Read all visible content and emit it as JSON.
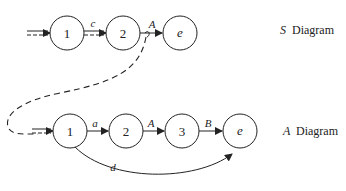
{
  "diagrams": [
    {
      "id": "S",
      "caption_symbol": "S",
      "caption_text": "Diagram",
      "nodes": [
        {
          "label": "1",
          "italic": false
        },
        {
          "label": "2",
          "italic": false
        },
        {
          "label": "e",
          "italic": true
        }
      ],
      "edges": [
        {
          "from": "start",
          "to": "1",
          "label": "",
          "style": "double-dashed"
        },
        {
          "from": "1",
          "to": "2",
          "label": "c",
          "style": "double-dashed"
        },
        {
          "from": "2",
          "to": "e",
          "label": "A",
          "style": "solid"
        }
      ]
    },
    {
      "id": "A",
      "caption_symbol": "A",
      "caption_text": "Diagram",
      "nodes": [
        {
          "label": "1",
          "italic": false
        },
        {
          "label": "2",
          "italic": false
        },
        {
          "label": "3",
          "italic": false
        },
        {
          "label": "e",
          "italic": true
        }
      ],
      "edges": [
        {
          "from": "start",
          "to": "1",
          "label": "",
          "style": "double-dashed"
        },
        {
          "from": "1",
          "to": "2",
          "label": "a",
          "style": "solid"
        },
        {
          "from": "2",
          "to": "3",
          "label": "A",
          "style": "solid"
        },
        {
          "from": "3",
          "to": "e",
          "label": "B",
          "style": "solid"
        },
        {
          "from": "1",
          "to": "e",
          "label": "d",
          "style": "curved"
        }
      ]
    }
  ],
  "call_link": {
    "from": "S.edge.A",
    "to": "A.start",
    "style": "dashed"
  }
}
